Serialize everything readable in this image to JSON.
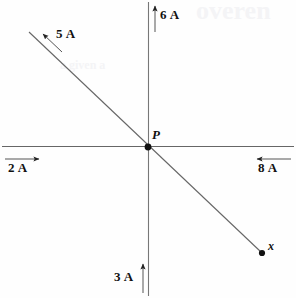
{
  "figure": {
    "background_color": "#fefefe",
    "line_color": "#555555",
    "text_color": "#111111",
    "width": 296,
    "height": 298
  },
  "junction": {
    "label": "P",
    "x": 148,
    "y": 147
  },
  "endpoint": {
    "label": "x",
    "x": 262,
    "y": 253
  },
  "currents": [
    {
      "id": "top",
      "label": "6 A",
      "direction": "up",
      "position": "top of vertical axis"
    },
    {
      "id": "upper-left-diagonal",
      "label": "5 A",
      "direction": "up-left",
      "position": "upper left along diagonal"
    },
    {
      "id": "left",
      "label": "2 A",
      "direction": "right",
      "position": "left end of horizontal axis"
    },
    {
      "id": "right",
      "label": "8 A",
      "direction": "left",
      "position": "right end of horizontal axis"
    },
    {
      "id": "bottom",
      "label": "3 A",
      "direction": "up",
      "position": "bottom of vertical axis"
    }
  ],
  "ghost_text": [
    {
      "text": "overen",
      "x": 196,
      "y": -4,
      "size": 26
    },
    {
      "text": "a given a",
      "x": 60,
      "y": 58,
      "size": 12
    }
  ]
}
